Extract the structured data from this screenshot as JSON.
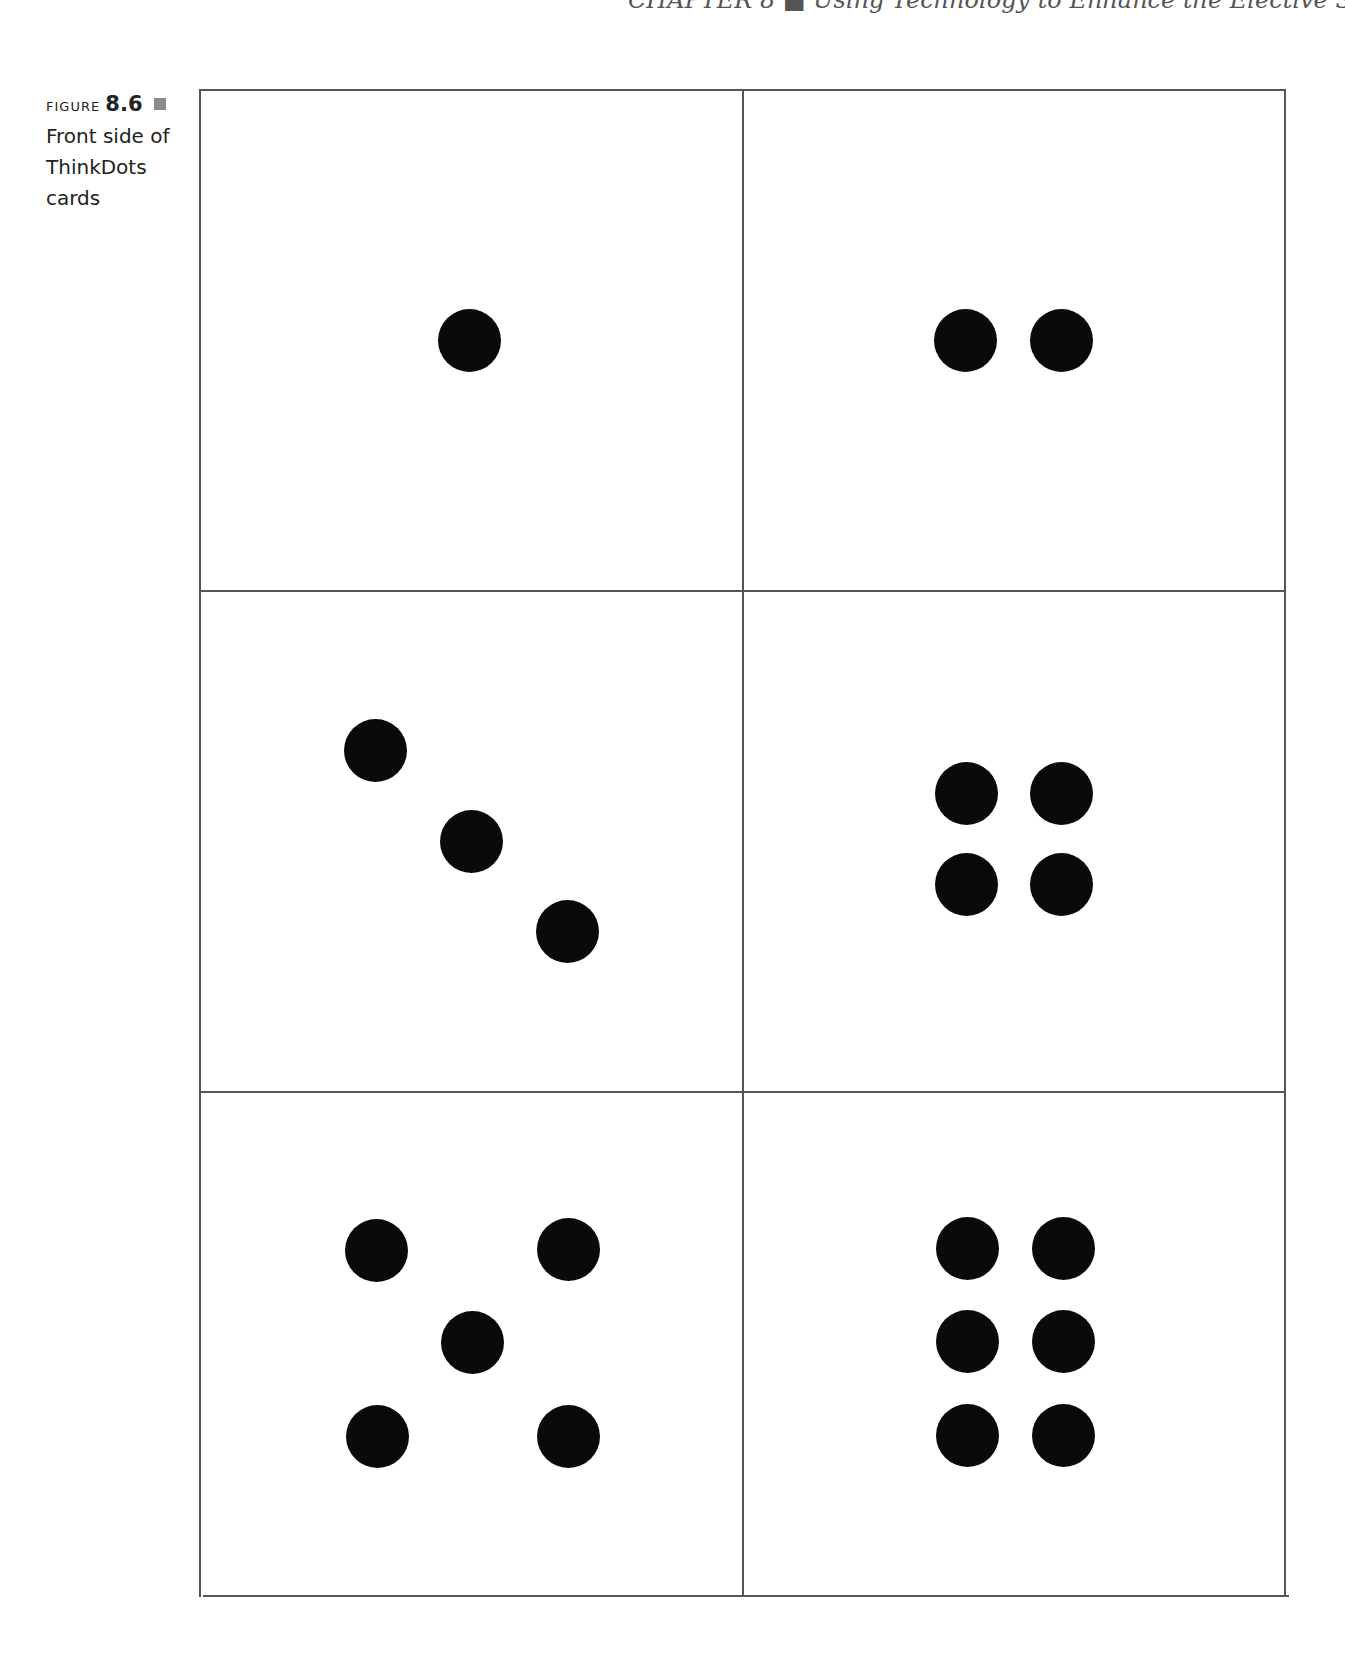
{
  "running_head": "CHAPTER 8 ■ Using Technology to Enhance the Elective Subjects",
  "figure": {
    "label": "FIGURE",
    "number": "8.6",
    "caption_lines": [
      "Front side of",
      "ThinkDots",
      "cards"
    ],
    "caption": "Front side of ThinkDots cards"
  },
  "cards": [
    {
      "position": "top-left",
      "dot_count": 1
    },
    {
      "position": "top-right",
      "dot_count": 2
    },
    {
      "position": "middle-left",
      "dot_count": 3
    },
    {
      "position": "middle-right",
      "dot_count": 4
    },
    {
      "position": "bottom-left",
      "dot_count": 5
    },
    {
      "position": "bottom-right",
      "dot_count": 6
    }
  ],
  "colors": {
    "dot": "#0a0a0a",
    "grid_line": "#555555",
    "caption_marker": "#8a8a8a"
  }
}
